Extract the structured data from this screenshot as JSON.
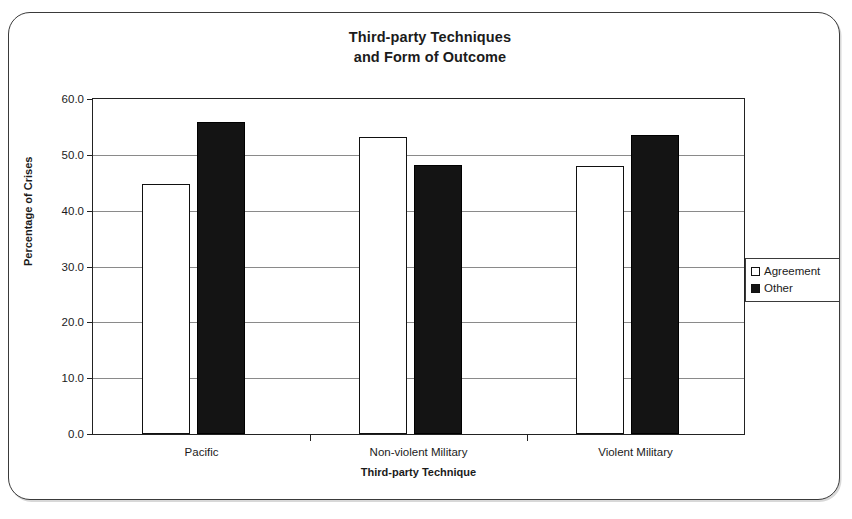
{
  "chart_data": {
    "type": "bar",
    "title": "Third-party Techniques and Form of Outcome",
    "title_line1": "Third-party Techniques",
    "title_line2": "and Form of Outcome",
    "xlabel": "Third-party Technique",
    "ylabel": "Percentage of Crises",
    "categories": [
      "Pacific",
      "Non-violent Military",
      "Violent Military"
    ],
    "series": [
      {
        "name": "Agreement",
        "values": [
          44.7,
          53.2,
          48.0
        ],
        "color": "#ffffff"
      },
      {
        "name": "Other",
        "values": [
          55.9,
          48.2,
          53.6
        ],
        "color": "#141414"
      }
    ],
    "ylim": [
      0.0,
      60.0
    ],
    "ytick_step": 10.0,
    "ytick_labels": [
      "0.0",
      "10.0",
      "20.0",
      "30.0",
      "40.0",
      "50.0",
      "60.0"
    ],
    "ytick_values": [
      0.0,
      10.0,
      20.0,
      30.0,
      40.0,
      50.0,
      60.0
    ],
    "grid": true,
    "grid_axis": "y",
    "legend_position": "right"
  },
  "legend": {
    "entries": [
      {
        "label": "Agreement",
        "swatch": "hollow-square-icon"
      },
      {
        "label": "Other",
        "swatch": "filled-square-icon"
      }
    ]
  }
}
